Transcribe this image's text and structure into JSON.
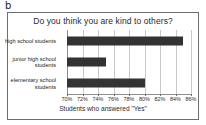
{
  "panel": {
    "label": "b"
  },
  "chart_data": {
    "type": "bar",
    "orientation": "horizontal",
    "title": "Do you think you are kind to others?",
    "xlabel": "Students who answered \"Yes\"",
    "ylabel": "",
    "categories": [
      "high school students",
      "junior high school students",
      "elementary school students"
    ],
    "values": [
      85,
      75,
      80
    ],
    "value_unit": "%",
    "xlim": [
      70,
      86
    ],
    "xticks": [
      70,
      72,
      74,
      76,
      78,
      80,
      82,
      84,
      86
    ],
    "xtick_labels": [
      "70%",
      "72%",
      "74%",
      "76%",
      "78%",
      "80%",
      "82%",
      "84%",
      "86%"
    ],
    "grid": true,
    "legend": false,
    "bar_color": "#333333",
    "gridline_color": "#c9c9c9",
    "frame_color": "#6e6e6e"
  }
}
